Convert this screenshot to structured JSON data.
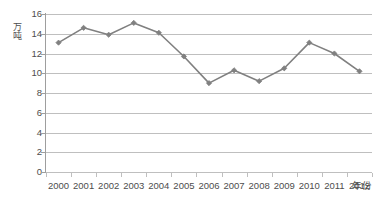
{
  "chart_data": {
    "type": "line",
    "title": "",
    "subtitle": "",
    "xlabel": "年份",
    "ylabel": "万吨",
    "categories": [
      "2000",
      "2001",
      "2002",
      "2003",
      "2004",
      "2005",
      "2006",
      "2007",
      "2008",
      "2009",
      "2010",
      "2011",
      "2012"
    ],
    "values": [
      13.1,
      14.6,
      13.9,
      15.1,
      14.1,
      11.7,
      9.0,
      10.3,
      9.2,
      10.5,
      13.1,
      12.0,
      10.2
    ],
    "series": [
      {
        "name": "",
        "values": [
          13.1,
          14.6,
          13.9,
          15.1,
          14.1,
          11.7,
          9.0,
          10.3,
          9.2,
          10.5,
          13.1,
          12.0,
          10.2
        ]
      }
    ],
    "ylim": [
      0,
      16
    ],
    "yticks": [
      0,
      2,
      4,
      6,
      8,
      10,
      12,
      14,
      16
    ],
    "ytick_labels": [
      "0",
      "2",
      "4",
      "6",
      "8",
      "10",
      "12",
      "14",
      "16"
    ],
    "grid": "horizontal",
    "legend": "none",
    "line_color": "#808080",
    "marker_color": "#808080",
    "marker": "diamond",
    "gridline_color": "#bfbfbf",
    "axis_color": "#9e9e9e",
    "background": "#ffffff"
  }
}
